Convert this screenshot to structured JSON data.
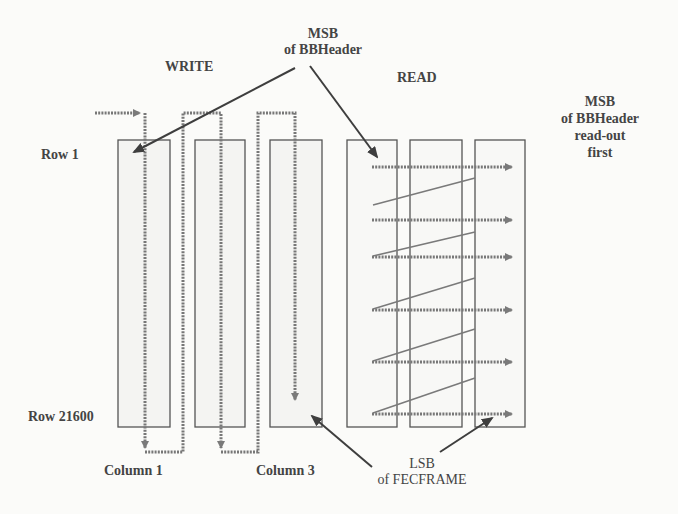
{
  "labels": {
    "write": "WRITE",
    "read": "READ",
    "msb_top_line1": "MSB",
    "msb_top_line2": "of BBHeader",
    "msb_right_line1": "MSB",
    "msb_right_line2": "of BBHeader",
    "msb_right_line3": "read-out",
    "msb_right_line4": "first",
    "row_first": "Row 1",
    "row_last": "Row 21600",
    "column_1": "Column 1",
    "column_3": "Column 3",
    "lsb_line1": "LSB",
    "lsb_line2": "of FECFRAME"
  },
  "colors": {
    "box_stroke": "#555555",
    "box_fill": "#f4f4f2",
    "arrow": "#6a6a6a",
    "pointer": "#3e3e3e"
  },
  "write_columns": [
    {
      "x": 118,
      "w": 52
    },
    {
      "x": 195,
      "w": 50
    },
    {
      "x": 270,
      "w": 52
    }
  ],
  "read_columns": [
    {
      "x": 347,
      "w": 50
    },
    {
      "x": 410,
      "w": 52
    },
    {
      "x": 475,
      "w": 50
    }
  ],
  "column_top": 140,
  "column_bottom": 427,
  "read_rows_y": [
    167,
    220,
    257,
    310,
    362,
    414
  ]
}
